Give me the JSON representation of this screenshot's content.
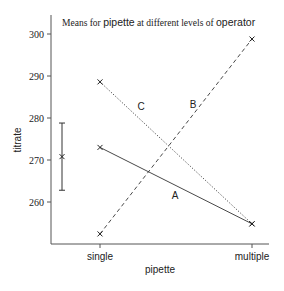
{
  "chart_data": {
    "type": "line",
    "title_parts": [
      {
        "text": "Means for ",
        "style": "serif"
      },
      {
        "text": "pipette",
        "style": "sans"
      },
      {
        "text": " at different levels of ",
        "style": "serif"
      },
      {
        "text": "operator",
        "style": "sans"
      }
    ],
    "title": "Means for pipette at different levels of operator",
    "xlabel": "pipette",
    "ylabel": "titrate",
    "categories": [
      "single",
      "multiple"
    ],
    "yticks": [
      260,
      270,
      280,
      290,
      300
    ],
    "ylim": [
      250.5,
      303.5
    ],
    "grid": false,
    "series": [
      {
        "name": "A",
        "values": [
          273.0,
          254.8
        ],
        "line_style": "solid"
      },
      {
        "name": "B",
        "values": [
          252.4,
          298.8
        ],
        "line_style": "dashed"
      },
      {
        "name": "C",
        "values": [
          288.6,
          254.8
        ],
        "line_style": "dotted"
      }
    ],
    "error_bar": {
      "center": 270.8,
      "low": 262.8,
      "high": 278.8
    },
    "marker": "x",
    "colors": {
      "line": "#222222",
      "axis": "#444444",
      "text": "#222222"
    }
  }
}
